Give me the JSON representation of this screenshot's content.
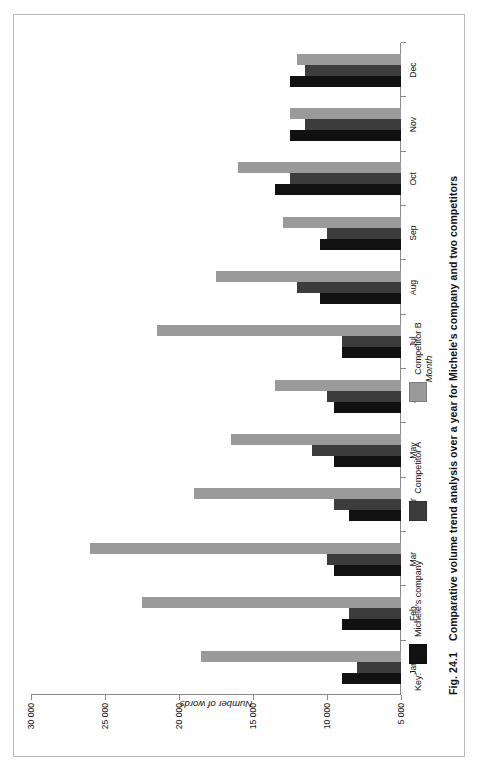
{
  "figure": {
    "caption_number": "Fig. 24.1",
    "caption_text": "Comparative volume trend analysis over a year for Michele's company and two competitors"
  },
  "legend": {
    "key_label": "Key:",
    "items": [
      {
        "label": "Michele's company",
        "color": "#111111"
      },
      {
        "label": "Competitor A",
        "color": "#3c3c3c"
      },
      {
        "label": "Competitor B",
        "color": "#9a9a9a"
      }
    ]
  },
  "chart_data": {
    "type": "bar",
    "title": "",
    "xlabel": "Month",
    "ylabel": "Number of words",
    "ylim": [
      5000,
      30000
    ],
    "yticks": [
      5000,
      10000,
      15000,
      20000,
      25000,
      30000
    ],
    "ytick_labels": [
      "5 000",
      "10 000",
      "15 000",
      "20 000",
      "25 000",
      "30 000"
    ],
    "grid": false,
    "legend_position": "below-left",
    "categories": [
      "Jan",
      "Feb",
      "Mar",
      "Apr",
      "May",
      "Jun",
      "Jul",
      "Aug",
      "Sep",
      "Oct",
      "Nov",
      "Dec"
    ],
    "series": [
      {
        "name": "Michele's company",
        "color": "#111111",
        "values": [
          9000,
          9000,
          9500,
          8500,
          9500,
          9500,
          9000,
          10500,
          10500,
          13500,
          12500,
          12500
        ]
      },
      {
        "name": "Competitor A",
        "color": "#3c3c3c",
        "values": [
          8000,
          8500,
          10000,
          9500,
          11000,
          10000,
          9000,
          12000,
          10000,
          12500,
          11500,
          11500
        ]
      },
      {
        "name": "Competitor B",
        "color": "#9a9a9a",
        "values": [
          18500,
          22500,
          26000,
          19000,
          16500,
          13500,
          21500,
          17500,
          13000,
          16000,
          12500,
          12000
        ]
      }
    ]
  }
}
